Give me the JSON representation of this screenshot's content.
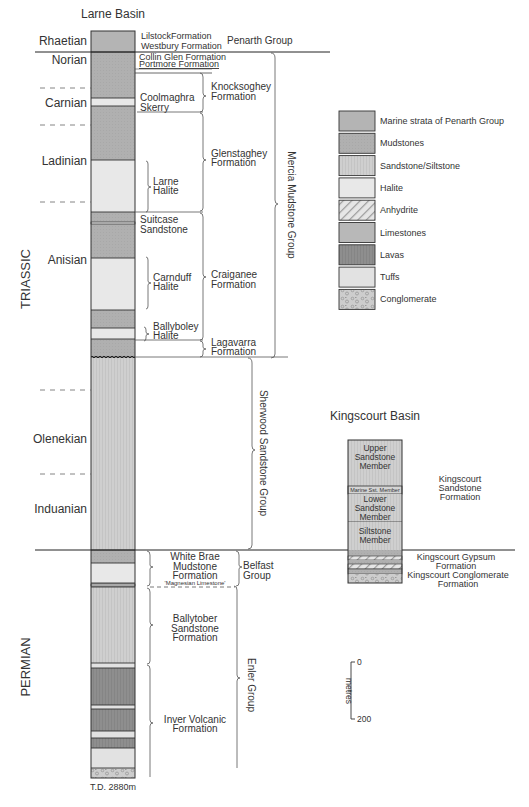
{
  "larne": {
    "title": "Larne Basin",
    "total_depth": "T.D. 2880m",
    "systems": [
      {
        "id": "triassic",
        "label": "TRIASSIC"
      },
      {
        "id": "permian",
        "label": "PERMIAN"
      }
    ],
    "stages": [
      {
        "id": "rhaetian",
        "label": "Rhaetian"
      },
      {
        "id": "norian",
        "label": "Norian"
      },
      {
        "id": "carnian",
        "label": "Carnian"
      },
      {
        "id": "ladinian",
        "label": "Ladinian"
      },
      {
        "id": "anisian",
        "label": "Anisian"
      },
      {
        "id": "olenekian",
        "label": "Olenekian"
      },
      {
        "id": "induanian",
        "label": "Induanian"
      }
    ],
    "formations": {
      "lilstock": "LilstockFormation",
      "westbury": "Westbury Formation",
      "collin_glen": "Collin Glen Formation",
      "portmore": "Portmore Formation",
      "coolmaghra_1": "Coolmaghra",
      "coolmaghra_2": "Skerry",
      "knocksoghey_1": "Knocksoghey",
      "knocksoghey_2": "Formation",
      "glenstaghey_1": "Glenstaghey",
      "glenstaghey_2": "Formation",
      "larne_halite_1": "Larne",
      "larne_halite_2": "Halite",
      "suitcase_1": "Suitcase",
      "suitcase_2": "Sandstone",
      "carnduff_1": "Carnduff",
      "carnduff_2": "Halite",
      "craiganee_1": "Craiganee",
      "craiganee_2": "Formation",
      "ballyboley_1": "Ballyboley",
      "ballyboley_2": "Halite",
      "lagavarra_1": "Lagavarra",
      "lagavarra_2": "Formation",
      "white_brae_1": "White Brae",
      "white_brae_2": "Mudstone",
      "white_brae_3": "Formation",
      "magnesian": "'Magnesian Limestone'",
      "ballytober_1": "Ballytober",
      "ballytober_2": "Sandstone",
      "ballytober_3": "Formation",
      "inver_1": "Inver Volcanic",
      "inver_2": "Formation"
    },
    "groups": {
      "penarth": "Penarth Group",
      "mercia": "Mercia Mudstone Group",
      "sherwood": "Sherwood Sandstone Group",
      "belfast_1": "Belfast",
      "belfast_2": "Group",
      "enler": "Enler Group"
    },
    "column_layers": [
      {
        "lithology": "penarth"
      },
      {
        "lithology": "mudstone"
      },
      {
        "lithology": "halite"
      },
      {
        "lithology": "mudstone"
      },
      {
        "lithology": "halite"
      },
      {
        "lithology": "mudstone"
      },
      {
        "lithology": "halite"
      },
      {
        "lithology": "mudstone"
      },
      {
        "lithology": "halite"
      },
      {
        "lithology": "mudstone"
      },
      {
        "lithology": "sandstone"
      },
      {
        "lithology": "mudstone"
      },
      {
        "lithology": "halite"
      },
      {
        "lithology": "limestone"
      },
      {
        "lithology": "sandstone"
      },
      {
        "lithology": "tuffs"
      },
      {
        "lithology": "lavas"
      },
      {
        "lithology": "tuffs"
      },
      {
        "lithology": "lavas"
      },
      {
        "lithology": "tuffs"
      },
      {
        "lithology": "lavas"
      },
      {
        "lithology": "tuffs"
      },
      {
        "lithology": "conglomerate"
      }
    ]
  },
  "legend": {
    "items": [
      {
        "key": "penarth",
        "label": "Marine strata of Penarth Group",
        "color": "#b4b4b4"
      },
      {
        "key": "mudstone",
        "label": "Mudstones",
        "color": "#b0b0b0"
      },
      {
        "key": "sandstone",
        "label": "Sandstone/Siltstone",
        "color": "#cfcfcf"
      },
      {
        "key": "halite",
        "label": "Halite",
        "color": "#e8e8e8"
      },
      {
        "key": "anhydrite",
        "label": "Anhydrite",
        "color": "#e6e6e6"
      },
      {
        "key": "limestone",
        "label": "Limestones",
        "color": "#b8b8b8"
      },
      {
        "key": "lavas",
        "label": "Lavas",
        "color": "#8e8e8e"
      },
      {
        "key": "tuffs",
        "label": "Tuffs",
        "color": "#e2e2e2"
      },
      {
        "key": "conglomerate",
        "label": "Conglomerate",
        "color": "#cdcdcd"
      }
    ]
  },
  "kingscourt": {
    "title": "Kingscourt Basin",
    "members": {
      "upper_1": "Upper",
      "upper_2": "Sandstone",
      "upper_3": "Member",
      "marine": "Marine Sst. Member",
      "lower_1": "Lower",
      "lower_2": "Sandstone",
      "lower_3": "Member",
      "siltstone_1": "Siltstone",
      "siltstone_2": "Member"
    },
    "formations": {
      "sandstone_1": "Kingscourt",
      "sandstone_2": "Sandstone",
      "sandstone_3": "Formation",
      "gypsum_1": "Kingscourt Gypsum",
      "gypsum_2": "Formation",
      "conglomerate_1": "Kingscourt Conglomerate",
      "conglomerate_2": "Formation"
    }
  },
  "scale": {
    "unit": "metres",
    "min_label": "0",
    "max_label": "200"
  }
}
